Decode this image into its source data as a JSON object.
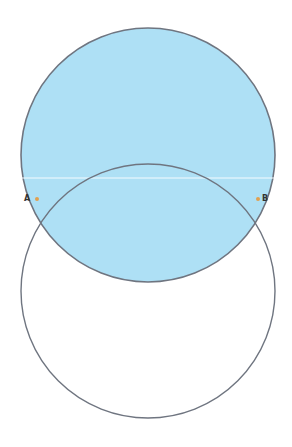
{
  "diagram": {
    "type": "two intersecting circles",
    "colors": {
      "background": "#ffffff",
      "shaded_fill": "#aee0f5",
      "circle_stroke": "#6f7580",
      "intersection_point": "#e0a050",
      "crease_line": "#f4fbff"
    },
    "circles": [
      {
        "id": "top",
        "cx": 148,
        "cy": 155,
        "r": 127,
        "filled": true
      },
      {
        "id": "bottom",
        "cx": 148,
        "cy": 291,
        "r": 127,
        "filled": false
      }
    ],
    "points": [
      {
        "label": "A",
        "x": 37,
        "y": 199,
        "label_x": 24,
        "label_y": 201
      },
      {
        "label": "B",
        "x": 258,
        "y": 199,
        "label_x": 262,
        "label_y": 201
      }
    ]
  }
}
